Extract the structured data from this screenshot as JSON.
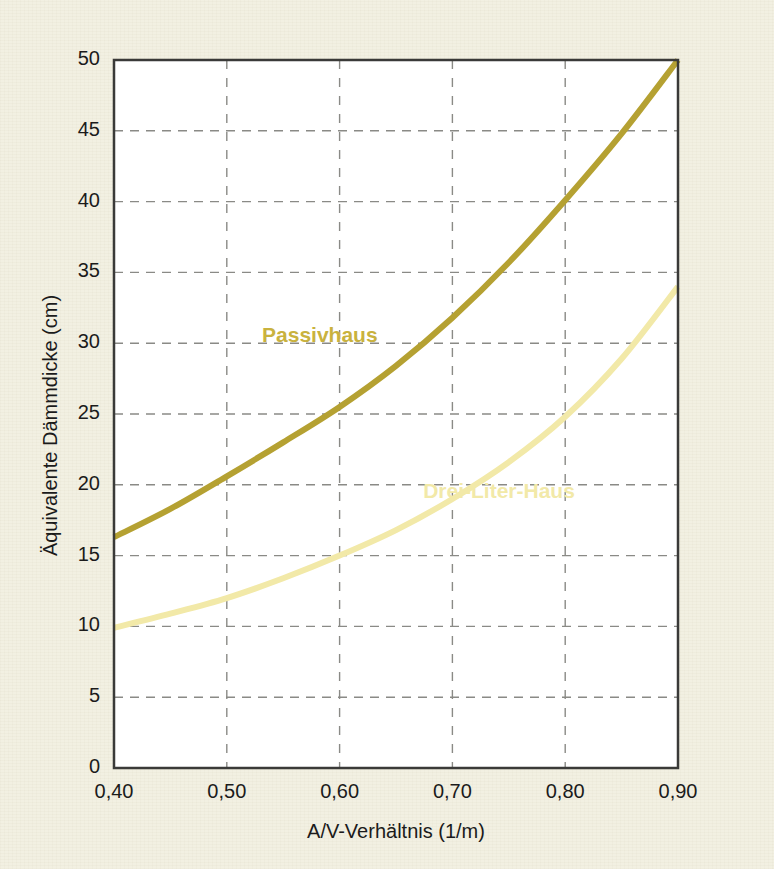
{
  "figure": {
    "background_color": "#f2f0e2",
    "plot_background_color": "#ffffff",
    "frame_color": "#3a3a38",
    "grid_color": "#8a8a86"
  },
  "chart_data": {
    "type": "line",
    "title": "",
    "subtitle": "",
    "xlabel": "A/V-Verhältnis (1/m)",
    "ylabel": "Äquivalente Dämmdicke (cm)",
    "xlim": [
      0.4,
      0.9
    ],
    "ylim": [
      0,
      50
    ],
    "grid": true,
    "legend_position": "inline-annotation",
    "xticks": [
      0.4,
      0.5,
      0.6,
      0.7,
      0.8,
      0.9
    ],
    "xtick_labels": [
      "0,40",
      "0,50",
      "0,60",
      "0,70",
      "0,80",
      "0,90"
    ],
    "yticks": [
      0,
      5,
      10,
      15,
      20,
      25,
      30,
      35,
      40,
      45,
      50
    ],
    "ytick_labels": [
      "0",
      "5",
      "10",
      "15",
      "20",
      "25",
      "30",
      "35",
      "40",
      "45",
      "50"
    ],
    "x": [
      0.4,
      0.45,
      0.5,
      0.55,
      0.6,
      0.65,
      0.7,
      0.75,
      0.8,
      0.85,
      0.9
    ],
    "series": [
      {
        "name": "Passivhaus",
        "color": "#b5a132",
        "label_color": "#c9b23e",
        "line_width": 6,
        "values": [
          16.3,
          18.3,
          20.6,
          23.0,
          25.5,
          28.4,
          31.8,
          35.7,
          40.1,
          44.8,
          50.0
        ]
      },
      {
        "name": "Drei-Liter-Haus",
        "color": "#f2e9a8",
        "label_color": "#f2e9a8",
        "line_width": 6,
        "values": [
          9.9,
          10.9,
          12.0,
          13.4,
          15.0,
          16.8,
          19.0,
          21.6,
          24.8,
          28.9,
          34.0
        ]
      }
    ],
    "annotations": [
      {
        "text": "Passivhaus",
        "x": 0.58,
        "y": 30.5,
        "color": "#c9b23e"
      },
      {
        "text": "Drei-Liter-Haus",
        "x": 0.745,
        "y": 19.5,
        "color": "#f2e9a8"
      }
    ]
  }
}
